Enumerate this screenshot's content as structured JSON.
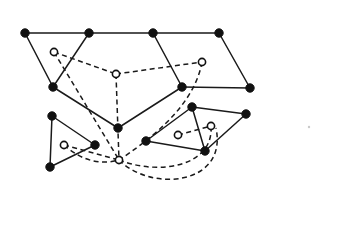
{
  "figure": {
    "canvas": {
      "width": 361,
      "height": 243,
      "background": "#ffffff"
    },
    "styles": {
      "solid_edge_color": "#1a1a1a",
      "dashed_edge_color": "#1a1a1a",
      "filled_node_color": "#111111",
      "hollow_node_fill": "#ffffff",
      "hollow_node_stroke": "#111111",
      "filled_node_radius": 4.2,
      "hollow_node_radius": 3.6,
      "edge_width": 1.5,
      "dash_pattern": "5 3.5"
    },
    "counts": {
      "filled_nodes": 14,
      "hollow_nodes": 7,
      "solid_edges": 17,
      "dashed_edges": 12
    },
    "nodes": [
      {
        "id": "f1",
        "type": "filled",
        "x": 25,
        "y": 33
      },
      {
        "id": "f2",
        "type": "filled",
        "x": 89,
        "y": 33
      },
      {
        "id": "f3",
        "type": "filled",
        "x": 153,
        "y": 33
      },
      {
        "id": "f4",
        "type": "filled",
        "x": 219,
        "y": 33
      },
      {
        "id": "f5",
        "type": "filled",
        "x": 53,
        "y": 87
      },
      {
        "id": "f6",
        "type": "filled",
        "x": 182,
        "y": 87
      },
      {
        "id": "f7",
        "type": "filled",
        "x": 250,
        "y": 88
      },
      {
        "id": "f8",
        "type": "filled",
        "x": 118,
        "y": 128
      },
      {
        "id": "f9",
        "type": "filled",
        "x": 52,
        "y": 116
      },
      {
        "id": "f10",
        "type": "filled",
        "x": 50,
        "y": 167
      },
      {
        "id": "f11",
        "type": "filled",
        "x": 95,
        "y": 145
      },
      {
        "id": "f12",
        "type": "filled",
        "x": 192,
        "y": 107
      },
      {
        "id": "f13",
        "type": "filled",
        "x": 246,
        "y": 114
      },
      {
        "id": "f14",
        "type": "filled",
        "x": 146,
        "y": 141
      },
      {
        "id": "f15",
        "type": "filled",
        "x": 205,
        "y": 151
      },
      {
        "id": "h1",
        "type": "hollow",
        "x": 54,
        "y": 52
      },
      {
        "id": "h2",
        "type": "hollow",
        "x": 116,
        "y": 74
      },
      {
        "id": "h3",
        "type": "hollow",
        "x": 202,
        "y": 62
      },
      {
        "id": "h4",
        "type": "hollow",
        "x": 119,
        "y": 160
      },
      {
        "id": "h5",
        "type": "hollow",
        "x": 64,
        "y": 145
      },
      {
        "id": "h6",
        "type": "hollow",
        "x": 178,
        "y": 135
      },
      {
        "id": "h7",
        "type": "hollow",
        "x": 211,
        "y": 126
      }
    ],
    "solid_edges": [
      {
        "from": "f1",
        "to": "f2"
      },
      {
        "from": "f2",
        "to": "f3"
      },
      {
        "from": "f3",
        "to": "f4"
      },
      {
        "from": "f1",
        "to": "f5"
      },
      {
        "from": "f2",
        "to": "f5"
      },
      {
        "from": "f3",
        "to": "f6"
      },
      {
        "from": "f4",
        "to": "f7"
      },
      {
        "from": "f6",
        "to": "f7"
      },
      {
        "from": "f5",
        "to": "f8"
      },
      {
        "from": "f6",
        "to": "f8"
      },
      {
        "from": "f9",
        "to": "f10"
      },
      {
        "from": "f9",
        "to": "f11"
      },
      {
        "from": "f10",
        "to": "f11"
      },
      {
        "from": "f12",
        "to": "f13"
      },
      {
        "from": "f12",
        "to": "f14"
      },
      {
        "from": "f12",
        "to": "f15"
      },
      {
        "from": "f14",
        "to": "f15"
      },
      {
        "from": "f13",
        "to": "f15"
      }
    ],
    "dashed_edges": [
      {
        "from": "h1",
        "to": "h2"
      },
      {
        "from": "h2",
        "to": "h3"
      },
      {
        "from": "h1",
        "to": "h4"
      },
      {
        "from": "h2",
        "to": "h4"
      },
      {
        "from": "h5",
        "to": "h4"
      },
      {
        "from": "h6",
        "to": "h7"
      }
    ],
    "dashed_curves": [
      {
        "id": "c1",
        "from": "h3",
        "to": "h4",
        "note": "long sweeping arc down-left"
      },
      {
        "id": "c2",
        "from": "h4",
        "to": "h7",
        "note": "arc sweeping right through cluster"
      },
      {
        "id": "c3",
        "from": "h4",
        "to": "h7",
        "note": "outer lower arc sweeping far right"
      },
      {
        "id": "c4",
        "from": "h5",
        "to": "h4",
        "note": "shallow arc from triangle hollow"
      }
    ],
    "speck": {
      "x": 309,
      "y": 127,
      "r": 1.2
    }
  }
}
